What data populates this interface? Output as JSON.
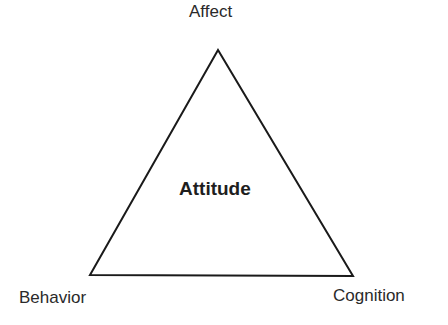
{
  "diagram": {
    "title": "Attitude",
    "shape": "triangle",
    "vertices": [
      {
        "label": "Affect",
        "position": "top"
      },
      {
        "label": "Behavior",
        "position": "bottom-left"
      },
      {
        "label": "Cognition",
        "position": "bottom-right"
      }
    ],
    "center_label": "Attitude",
    "line_color": "#1a1a1a",
    "background": "#ffffff"
  }
}
